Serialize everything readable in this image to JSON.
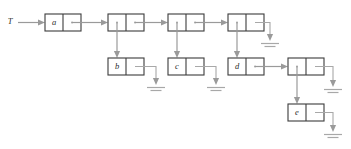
{
  "diagram": {
    "kind": "cons-cell-linked-structure",
    "root_label": "T",
    "colors": {
      "background": "#ffffff",
      "cell_border": "#3b3b3b",
      "pointer": "#9a9a9a",
      "ground": "#a8a8a8",
      "label_text": "#2b2b2b"
    },
    "cell_geometry": {
      "width": 36,
      "height": 17,
      "half_width": 18
    },
    "cells": [
      {
        "id": "cell-a",
        "label": "a",
        "x": 45,
        "y": 14,
        "car_label": "a",
        "cdr_label": ""
      },
      {
        "id": "cell-n1",
        "label": "",
        "x": 108,
        "y": 13,
        "car_label": "",
        "cdr_label": ""
      },
      {
        "id": "cell-n2",
        "label": "",
        "x": 168,
        "y": 13,
        "car_label": "",
        "cdr_label": ""
      },
      {
        "id": "cell-n3",
        "label": "",
        "x": 228,
        "y": 13,
        "car_label": "",
        "cdr_label": ""
      },
      {
        "id": "cell-b",
        "label": "b",
        "x": 108,
        "y": 58,
        "car_label": "b",
        "cdr_label": ""
      },
      {
        "id": "cell-c",
        "label": "c",
        "x": 168,
        "y": 58,
        "car_label": "c",
        "cdr_label": ""
      },
      {
        "id": "cell-d",
        "label": "d",
        "x": 228,
        "y": 58,
        "car_label": "d",
        "cdr_label": ""
      },
      {
        "id": "cell-n4",
        "label": "",
        "x": 288,
        "y": 58,
        "car_label": "",
        "cdr_label": ""
      },
      {
        "id": "cell-e",
        "label": "e",
        "x": 288,
        "y": 104,
        "car_label": "e",
        "cdr_label": ""
      }
    ],
    "pointers": [
      {
        "id": "ptr-root-to-a",
        "from": "root",
        "to": "cell-a",
        "direction": "right"
      },
      {
        "id": "ptr-a-to-n1",
        "from": "cell-a",
        "to": "cell-n1",
        "direction": "right"
      },
      {
        "id": "ptr-n1-to-n2",
        "from": "cell-n1",
        "to": "cell-n2",
        "direction": "right"
      },
      {
        "id": "ptr-n2-to-n3",
        "from": "cell-n2",
        "to": "cell-n3",
        "direction": "right"
      },
      {
        "id": "ptr-n1-to-b",
        "from": "cell-n1",
        "to": "cell-b",
        "direction": "down"
      },
      {
        "id": "ptr-n2-to-c",
        "from": "cell-n2",
        "to": "cell-c",
        "direction": "down"
      },
      {
        "id": "ptr-n3-to-d",
        "from": "cell-n3",
        "to": "cell-d",
        "direction": "down"
      },
      {
        "id": "ptr-d-to-n4",
        "from": "cell-d",
        "to": "cell-n4",
        "direction": "right"
      },
      {
        "id": "ptr-n4-to-e",
        "from": "cell-n4",
        "to": "cell-e",
        "direction": "down"
      }
    ],
    "nil_terminators": [
      {
        "id": "nil-n3-cdr",
        "source": "cell-n3",
        "x": 270,
        "y": 42
      },
      {
        "id": "nil-b-cdr",
        "source": "cell-b",
        "x": 156,
        "y": 86
      },
      {
        "id": "nil-c-cdr",
        "source": "cell-c",
        "x": 216,
        "y": 86
      },
      {
        "id": "nil-n4-cdr",
        "source": "cell-n4",
        "x": 333,
        "y": 88
      },
      {
        "id": "nil-e-cdr",
        "source": "cell-e",
        "x": 333,
        "y": 133
      }
    ]
  }
}
